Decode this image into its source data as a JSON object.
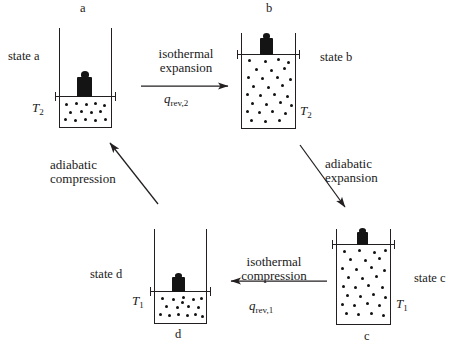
{
  "diagram": {
    "ink_color": "#231f20",
    "gas_dot_color": "#111111",
    "piston_color": "#141414"
  },
  "states": [
    {
      "id": "a",
      "letter": "a",
      "state_label": "state a",
      "temperature": "T",
      "temperature_sub": "2",
      "letter_position": "top",
      "piston_level": "low",
      "dot_count": 14
    },
    {
      "id": "b",
      "letter": "b",
      "state_label": "state b",
      "temperature": "T",
      "temperature_sub": "2",
      "letter_position": "top",
      "piston_level": "high",
      "dot_count": 29
    },
    {
      "id": "c",
      "letter": "c",
      "state_label": "state c",
      "temperature": "T",
      "temperature_sub": "1",
      "letter_position": "bottom",
      "piston_level": "high",
      "dot_count": 30
    },
    {
      "id": "d",
      "letter": "d",
      "state_label": "state d",
      "temperature": "T",
      "temperature_sub": "1",
      "letter_position": "bottom",
      "piston_level": "low",
      "dot_count": 16
    }
  ],
  "processes": [
    {
      "id": "a-to-b",
      "line1": "isothermal",
      "line2": "expansion",
      "heat_symbol": "q",
      "heat_sub": "rev,2",
      "direction": "right"
    },
    {
      "id": "b-to-c",
      "line1": "adiabatic",
      "line2": "expansion",
      "heat_symbol": "",
      "heat_sub": "",
      "direction": "down-right"
    },
    {
      "id": "c-to-d",
      "line1": "isothermal",
      "line2": "compression",
      "heat_symbol": "q",
      "heat_sub": "rev,1",
      "direction": "left"
    },
    {
      "id": "d-to-a",
      "line1": "adiabatic",
      "line2": "compression",
      "heat_symbol": "",
      "heat_sub": "",
      "direction": "up-left"
    }
  ]
}
